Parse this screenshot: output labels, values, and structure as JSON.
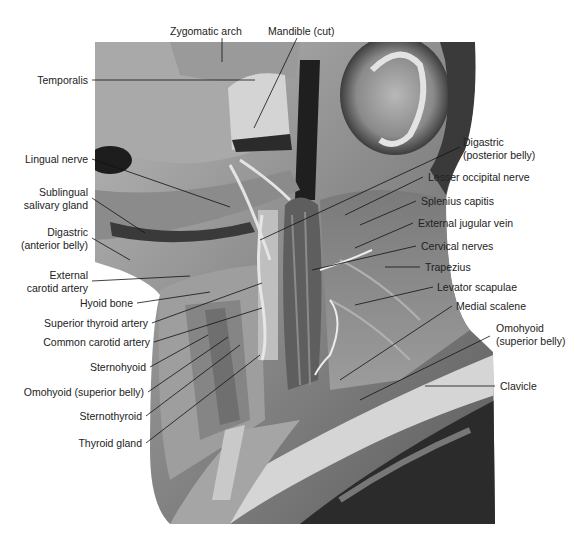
{
  "figure": {
    "colors": {
      "background": "#ffffff",
      "label_text": "#222222",
      "leader_line": "#111111",
      "tissue_light": "#c8c8c8",
      "tissue_mid": "#8a8a8a",
      "tissue_dark": "#2a2a2a"
    }
  },
  "labels": {
    "top": [
      {
        "id": "zygomatic-arch",
        "text": "Zygomatic arch"
      },
      {
        "id": "mandible-cut",
        "text": "Mandible (cut)"
      }
    ],
    "left": [
      {
        "id": "temporalis",
        "lines": [
          "Temporalis"
        ]
      },
      {
        "id": "lingual-nerve",
        "lines": [
          "Lingual nerve"
        ]
      },
      {
        "id": "sublingual-salivary-gland",
        "lines": [
          "Sublingual",
          "salivary gland"
        ]
      },
      {
        "id": "digastric-anterior-belly",
        "lines": [
          "Digastric",
          "(anterior belly)"
        ]
      },
      {
        "id": "external-carotid-artery",
        "lines": [
          "External",
          "carotid artery"
        ]
      },
      {
        "id": "hyoid-bone",
        "lines": [
          "Hyoid bone"
        ]
      },
      {
        "id": "superior-thyroid-artery",
        "lines": [
          "Superior thyroid artery"
        ]
      },
      {
        "id": "common-carotid-artery",
        "lines": [
          "Common carotid artery"
        ]
      },
      {
        "id": "sternohyoid",
        "lines": [
          "Sternohyoid"
        ]
      },
      {
        "id": "omohyoid-superior-belly-left",
        "lines": [
          "Omohyoid (superior belly)"
        ]
      },
      {
        "id": "sternothyroid",
        "lines": [
          "Sternothyroid"
        ]
      },
      {
        "id": "thyroid-gland",
        "lines": [
          "Thyroid gland"
        ]
      }
    ],
    "right": [
      {
        "id": "digastric-posterior-belly",
        "lines": [
          "Digastric",
          "(posterior belly)"
        ]
      },
      {
        "id": "lesser-occipital-nerve",
        "lines": [
          "Lesser occipital nerve"
        ]
      },
      {
        "id": "splenius-capitis",
        "lines": [
          "Splenius capitis"
        ]
      },
      {
        "id": "external-jugular-vein",
        "lines": [
          "External jugular vein"
        ]
      },
      {
        "id": "cervical-nerves",
        "lines": [
          "Cervical nerves"
        ]
      },
      {
        "id": "trapezius",
        "lines": [
          "Trapezius"
        ]
      },
      {
        "id": "levator-scapulae",
        "lines": [
          "Levator scapulae"
        ]
      },
      {
        "id": "medial-scalene",
        "lines": [
          "Medial scalene"
        ]
      },
      {
        "id": "omohyoid-superior-belly-right",
        "lines": [
          "Omohyoid",
          "(superior belly)"
        ]
      },
      {
        "id": "clavicle",
        "lines": [
          "Clavicle"
        ]
      }
    ]
  }
}
